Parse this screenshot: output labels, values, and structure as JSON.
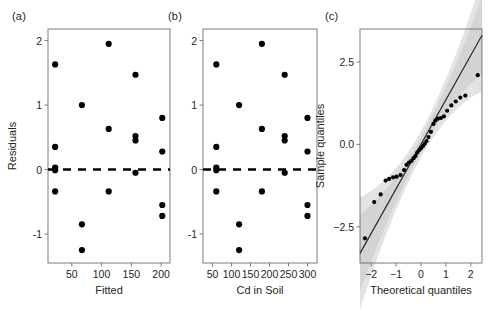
{
  "figure": {
    "background": "#ffffff",
    "point_color": "#000000",
    "frame_color": "#6d6e71",
    "band_color": "#d9d9d9"
  },
  "panels": [
    {
      "label": "(a)",
      "xlabel": "Fitted",
      "ylabel": "Residuals"
    },
    {
      "label": "(b)",
      "xlabel": "Cd in Soil",
      "ylabel": ""
    },
    {
      "label": "(c)",
      "xlabel": "Theoretical quantiles",
      "ylabel": "Sample quantiles"
    }
  ],
  "chart_data": [
    {
      "type": "scatter",
      "title": "(a)",
      "xlabel": "Fitted",
      "ylabel": "Residuals",
      "xlim": [
        10,
        215
      ],
      "ylim": [
        -1.45,
        2.18
      ],
      "xticks": [
        50,
        100,
        150,
        200
      ],
      "yticks": [
        2,
        1,
        0,
        -1
      ],
      "xtick_labels": [
        "50",
        "100",
        "150",
        "200"
      ],
      "ytick_labels": [
        "2",
        "1",
        "0",
        "-1"
      ],
      "grid": false,
      "reference_line": {
        "type": "horizontal",
        "y": 0,
        "style": "dashed"
      },
      "x": [
        22,
        22,
        22,
        22,
        22,
        67,
        67,
        67,
        67,
        112,
        112,
        112,
        112,
        157,
        157,
        157,
        157,
        202,
        202,
        202,
        202,
        202
      ],
      "y": [
        1.63,
        0.35,
        0.03,
        0.0,
        -0.34,
        1.0,
        -0.85,
        -1.25,
        0.0,
        1.95,
        0.63,
        -0.34,
        0.0,
        1.47,
        0.52,
        0.45,
        -0.05,
        0.8,
        0.28,
        -0.55,
        -0.72,
        0.0
      ],
      "points": [
        {
          "x": 22,
          "y": 1.63
        },
        {
          "x": 22,
          "y": 0.35
        },
        {
          "x": 22,
          "y": 0.03
        },
        {
          "x": 22,
          "y": -0.01
        },
        {
          "x": 22,
          "y": -0.34
        },
        {
          "x": 67,
          "y": 1.0
        },
        {
          "x": 67,
          "y": -0.85
        },
        {
          "x": 67,
          "y": -1.25
        },
        {
          "x": 112,
          "y": 1.95
        },
        {
          "x": 112,
          "y": 0.63
        },
        {
          "x": 112,
          "y": -0.34
        },
        {
          "x": 157,
          "y": 1.47
        },
        {
          "x": 157,
          "y": 0.52
        },
        {
          "x": 157,
          "y": 0.45
        },
        {
          "x": 157,
          "y": -0.05
        },
        {
          "x": 202,
          "y": 0.8
        },
        {
          "x": 202,
          "y": 0.28
        },
        {
          "x": 202,
          "y": -0.55
        },
        {
          "x": 202,
          "y": -0.72
        }
      ]
    },
    {
      "type": "scatter",
      "title": "(b)",
      "xlabel": "Cd in Soil",
      "ylabel": "Residuals",
      "xlim": [
        25,
        325
      ],
      "ylim": [
        -1.45,
        2.18
      ],
      "xticks": [
        50,
        100,
        150,
        200,
        250,
        300
      ],
      "yticks": [
        2,
        1,
        0,
        -1
      ],
      "xtick_labels": [
        "50",
        "100",
        "150",
        "200",
        "250",
        "300"
      ],
      "ytick_labels": [
        "2",
        "1",
        "0",
        "-1"
      ],
      "grid": false,
      "reference_line": {
        "type": "horizontal",
        "y": 0,
        "style": "dashed"
      },
      "points": [
        {
          "x": 60,
          "y": 1.63
        },
        {
          "x": 60,
          "y": 0.35
        },
        {
          "x": 60,
          "y": 0.03
        },
        {
          "x": 60,
          "y": -0.01
        },
        {
          "x": 60,
          "y": -0.34
        },
        {
          "x": 120,
          "y": 1.0
        },
        {
          "x": 120,
          "y": -0.85
        },
        {
          "x": 120,
          "y": -1.25
        },
        {
          "x": 180,
          "y": 1.95
        },
        {
          "x": 180,
          "y": 0.63
        },
        {
          "x": 180,
          "y": -0.34
        },
        {
          "x": 240,
          "y": 1.47
        },
        {
          "x": 240,
          "y": 0.52
        },
        {
          "x": 240,
          "y": 0.45
        },
        {
          "x": 240,
          "y": -0.05
        },
        {
          "x": 300,
          "y": 0.8
        },
        {
          "x": 300,
          "y": 0.28
        },
        {
          "x": 300,
          "y": -0.55
        },
        {
          "x": 300,
          "y": -0.72
        }
      ]
    },
    {
      "type": "scatter",
      "title": "(c)",
      "xlabel": "Theoretical quantiles",
      "ylabel": "Sample quantiles",
      "xlim": [
        -2.45,
        2.45
      ],
      "ylim": [
        -3.6,
        3.5
      ],
      "xticks": [
        -2,
        -1,
        0,
        1,
        2
      ],
      "yticks": [
        2.5,
        0.0,
        -2.5
      ],
      "xtick_labels": [
        "−2",
        "−1",
        "0",
        "1",
        "2"
      ],
      "ytick_labels": [
        "2.5",
        "0.0",
        "−2.5"
      ],
      "grid": false,
      "reference_line": {
        "type": "qq",
        "intercept": 0.0,
        "slope": 1.35
      },
      "confidence_band": true,
      "points": [
        {
          "x": -2.25,
          "y": -2.85
        },
        {
          "x": -1.88,
          "y": -1.75
        },
        {
          "x": -1.62,
          "y": -1.52
        },
        {
          "x": -1.42,
          "y": -1.1
        },
        {
          "x": -1.28,
          "y": -1.05
        },
        {
          "x": -1.12,
          "y": -1.0
        },
        {
          "x": -0.98,
          "y": -0.98
        },
        {
          "x": -0.82,
          "y": -0.93
        },
        {
          "x": -0.68,
          "y": -0.78
        },
        {
          "x": -0.58,
          "y": -0.62
        },
        {
          "x": -0.48,
          "y": -0.55
        },
        {
          "x": -0.38,
          "y": -0.5
        },
        {
          "x": -0.3,
          "y": -0.42
        },
        {
          "x": -0.22,
          "y": -0.35
        },
        {
          "x": -0.15,
          "y": -0.25
        },
        {
          "x": -0.08,
          "y": -0.18
        },
        {
          "x": 0.0,
          "y": -0.12
        },
        {
          "x": 0.08,
          "y": -0.05
        },
        {
          "x": 0.15,
          "y": 0.02
        },
        {
          "x": 0.22,
          "y": 0.1
        },
        {
          "x": 0.3,
          "y": 0.22
        },
        {
          "x": 0.4,
          "y": 0.38
        },
        {
          "x": 0.5,
          "y": 0.62
        },
        {
          "x": 0.58,
          "y": 0.72
        },
        {
          "x": 0.68,
          "y": 0.78
        },
        {
          "x": 0.8,
          "y": 0.8
        },
        {
          "x": 0.92,
          "y": 0.85
        },
        {
          "x": 1.05,
          "y": 1.02
        },
        {
          "x": 1.22,
          "y": 1.18
        },
        {
          "x": 1.4,
          "y": 1.3
        },
        {
          "x": 1.58,
          "y": 1.42
        },
        {
          "x": 1.78,
          "y": 1.48
        },
        {
          "x": 2.28,
          "y": 2.1
        }
      ]
    }
  ]
}
